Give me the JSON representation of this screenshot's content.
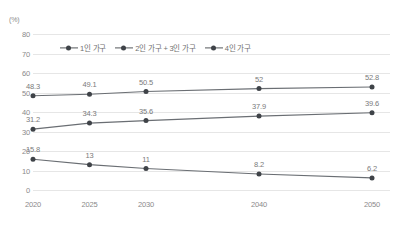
{
  "chart_data": {
    "type": "line",
    "title": "",
    "xlabel": "",
    "ylabel": "(%)",
    "unit_label": "(%)",
    "categories": [
      "2020",
      "2025",
      "2030",
      "2040",
      "2050"
    ],
    "x_values": [
      2020,
      2025,
      2030,
      2040,
      2050
    ],
    "xtick_labels": [
      "2020",
      "2025",
      "2030",
      "2040",
      "2050"
    ],
    "ytick_labels": [
      "80",
      "70",
      "60",
      "50",
      "40",
      "30",
      "20",
      "10",
      "0"
    ],
    "ytick_values": [
      80,
      70,
      60,
      50,
      40,
      30,
      20,
      10,
      0
    ],
    "ylim": [
      0,
      80
    ],
    "ystep": 10,
    "grid": true,
    "legend_position": "top-center",
    "series": [
      {
        "name": "1인 가구",
        "values": [
          48.3,
          49.1,
          50.5,
          52,
          52.8
        ],
        "labels": [
          "48.3",
          "49.1",
          "50.5",
          "52",
          "52.8"
        ],
        "color": "#6a6e73"
      },
      {
        "name": "2인 가구 + 3인 가구",
        "values": [
          31.2,
          34.3,
          35.6,
          37.9,
          39.6
        ],
        "labels": [
          "31.2",
          "34.3",
          "35.6",
          "37.9",
          "39.6"
        ],
        "color": "#6a6e73"
      },
      {
        "name": "4인 가구",
        "values": [
          15.8,
          13,
          11,
          8.2,
          6.2
        ],
        "labels": [
          "15.8",
          "13",
          "11",
          "8.2",
          "6.2"
        ],
        "color": "#6a6e73"
      }
    ],
    "colors": {
      "line": "#6a6e73",
      "marker": "#3f4348",
      "gridline": "#e6e6e6",
      "axis_text": "#8a8a8a",
      "data_label": "#7a7a7a",
      "background": "#ffffff"
    }
  }
}
